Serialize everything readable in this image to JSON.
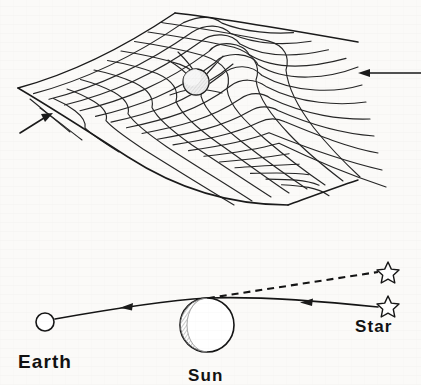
{
  "figure": {
    "background_color": "#fbfaf8",
    "ink_color": "#1a1a1a",
    "panels": [
      {
        "id": "spacetime-grid",
        "caption": "",
        "description": "Rubber-sheet grid warped by a massive sphere",
        "grid": {
          "rows": 10,
          "cols": 10,
          "corner_left": [
            18,
            88
          ],
          "corner_top": [
            175,
            13
          ],
          "corner_right": [
            358,
            42
          ],
          "corner_bottom": [
            288,
            205
          ]
        },
        "mass_sphere": {
          "center_x": 196,
          "center_y": 82,
          "radius": 13,
          "fill": "#ebebeb"
        },
        "annotation_arrows": [
          {
            "name": "right-incoming-arrow",
            "from_x": 421,
            "from_y": 73,
            "to_x": 359,
            "to_y": 73,
            "direction": "left"
          },
          {
            "name": "left-incoming-arrow",
            "from_x": 20,
            "from_y": 132,
            "to_x": 52,
            "to_y": 113,
            "direction": "up-right"
          }
        ]
      },
      {
        "id": "light-bending",
        "caption": "",
        "description": "Light ray from a star grazing the Sun and reaching the Earth",
        "objects": [
          {
            "name": "earth",
            "label": "Earth",
            "center_x": 45,
            "center_y": 322,
            "radius": 9,
            "label_x": 18,
            "label_y": 365,
            "fill": "#ffffff"
          },
          {
            "name": "sun",
            "label": "Sun",
            "center_x": 207,
            "center_y": 325,
            "radius": 27,
            "label_x": 187,
            "label_y": 378,
            "fill": "#ffffff",
            "shading": "hatched-left-crescent"
          },
          {
            "name": "star-actual",
            "label": "Star",
            "star_x": 388,
            "star_y": 305,
            "label_x": 355,
            "label_y": 330,
            "line_style": "solid"
          },
          {
            "name": "star-apparent",
            "label": "",
            "star_x": 388,
            "star_y": 271,
            "line_style": "dashed"
          }
        ],
        "rays": [
          {
            "name": "real-light-path",
            "style": "solid",
            "points": [
              [
                54,
                319
              ],
              [
                196,
                300
              ],
              [
                378,
                307
              ]
            ],
            "arrow_positions": [
              [
                128,
                306
              ],
              [
                307,
                302
              ]
            ],
            "arrow_direction": "left"
          },
          {
            "name": "apparent-light-path",
            "style": "dashed",
            "points": [
              [
                196,
                300
              ],
              [
                378,
                273
              ]
            ]
          }
        ]
      }
    ]
  },
  "labels": {
    "earth": "Earth",
    "sun": "Sun",
    "star": "Star"
  },
  "icons": {
    "star_actual": "star-icon",
    "star_apparent": "star-icon",
    "earth_body": "circle-icon",
    "sun_body": "circle-icon",
    "arrow_right_incoming": "arrow-left-icon",
    "arrow_left_incoming": "arrow-up-right-icon"
  }
}
